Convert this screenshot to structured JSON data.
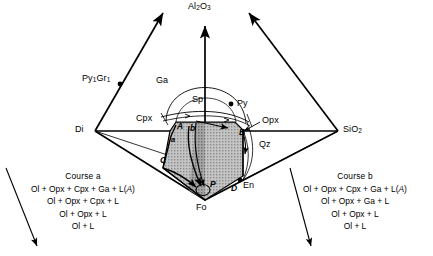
{
  "diagram": {
    "type": "phase-diagram-tetrahedron",
    "system": "CMAS",
    "apex_labels": {
      "top": "Al2O3",
      "top_html": "Al<sub>2</sub>O<sub>3</sub>",
      "left": "Di",
      "right": "SiO2",
      "right_html": "SiO<sub>2</sub>",
      "bottom": "Fo"
    },
    "field_labels": [
      {
        "name": "garnet-field-label",
        "text": "Ga",
        "x": 156,
        "y": 80
      },
      {
        "name": "spinel-field-label",
        "text": "Sp",
        "x": 192,
        "y": 98
      },
      {
        "name": "clinopyroxene-label",
        "text": "Cpx",
        "x": 137,
        "y": 117
      },
      {
        "name": "orthopyroxene-label",
        "text": "Opx",
        "x": 262,
        "y": 120
      },
      {
        "name": "quartz-field-label",
        "text": "Qz",
        "x": 261,
        "y": 143
      },
      {
        "name": "enstatite-label",
        "text": "En",
        "x": 244,
        "y": 184
      }
    ],
    "point_labels": [
      {
        "name": "pyrope-grossular-point",
        "text": "Py1Gr1",
        "html": "Py<sub>1</sub>Gr<sub>1</sub>",
        "x": 87,
        "y": 79
      },
      {
        "name": "pyrope-point",
        "text": "Py",
        "html": "Py",
        "x": 237,
        "y": 102
      }
    ],
    "invariant_labels": [
      {
        "name": "point-A-label",
        "text": "A",
        "x": 178,
        "y": 127,
        "style": "ital"
      },
      {
        "name": "point-b-label",
        "text": "b",
        "x": 191,
        "y": 129,
        "style": "ital"
      },
      {
        "name": "point-a-label",
        "text": "a",
        "x": 172,
        "y": 140,
        "style": "ital-sm"
      },
      {
        "name": "point-C-label",
        "text": "C",
        "x": 161,
        "y": 160,
        "style": "ital"
      },
      {
        "name": "point-B-label",
        "text": "B",
        "x": 240,
        "y": 133,
        "style": "ital"
      },
      {
        "name": "point-P-label",
        "text": "P",
        "x": 211,
        "y": 184,
        "style": "ital"
      },
      {
        "name": "point-D-label",
        "text": "D",
        "x": 232,
        "y": 188,
        "style": "ital"
      }
    ],
    "courses": [
      {
        "name": "course-a",
        "title": "Course a",
        "x": 8,
        "y": 170,
        "width": 150,
        "steps": [
          {
            "pre": "Ol + Opx + Cpx + Ga + L(",
            "em": "A",
            "post": ")"
          },
          {
            "pre": "Ol + Opx + Cpx + L",
            "em": "",
            "post": ""
          },
          {
            "pre": "Ol + Opx + L",
            "em": "",
            "post": ""
          },
          {
            "pre": "Ol + L",
            "em": "",
            "post": ""
          }
        ]
      },
      {
        "name": "course-b",
        "title": "Course b",
        "x": 280,
        "y": 170,
        "width": 150,
        "steps": [
          {
            "pre": "Ol + Opx + Cpx + Ga + L(",
            "em": "A",
            "post": ")"
          },
          {
            "pre": "Ol + Opx + Ga + L",
            "em": "",
            "post": ""
          },
          {
            "pre": "Ol + Opx + L",
            "em": "",
            "post": ""
          },
          {
            "pre": "Ol + L",
            "em": "",
            "post": ""
          }
        ]
      }
    ],
    "colors": {
      "stroke": "#000000",
      "shade_fill": "#b8b8b8",
      "shade_dark": "#9a9a9a",
      "background": "#ffffff"
    }
  }
}
